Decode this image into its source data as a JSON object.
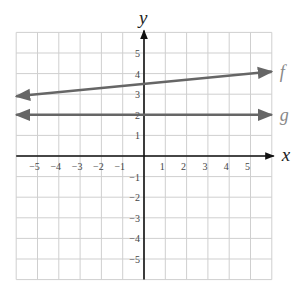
{
  "chart_data": {
    "type": "line",
    "title": "",
    "xlabel": "x",
    "ylabel": "y",
    "xlim": [
      -6,
      6
    ],
    "ylim": [
      -6,
      6
    ],
    "grid": true,
    "x_ticks": [
      -5,
      -4,
      -3,
      -2,
      -1,
      1,
      2,
      3,
      4,
      5
    ],
    "y_ticks": [
      -5,
      -4,
      -3,
      -2,
      -1,
      1,
      2,
      3,
      4,
      5
    ],
    "x_tick_labels": [
      "−5",
      "−4",
      "−3",
      "−2",
      "−1",
      "1",
      "2",
      "3",
      "4",
      "5"
    ],
    "y_tick_labels": [
      "−5",
      "−4",
      "−3",
      "−2",
      "−1",
      "1",
      "2",
      "3",
      "4",
      "5"
    ],
    "series": [
      {
        "name": "f",
        "x": [
          -6,
          6
        ],
        "y": [
          2.9,
          4.1
        ],
        "slope": 0.1,
        "intercept": 3.5,
        "color": "#666666"
      },
      {
        "name": "g",
        "x": [
          -6,
          6
        ],
        "y": [
          2,
          2
        ],
        "slope": 0,
        "intercept": 2,
        "color": "#666666"
      }
    ],
    "legend": "inline labels at right end"
  },
  "labels": {
    "x_axis": "x",
    "y_axis": "y",
    "f": "f",
    "g": "g"
  },
  "colors": {
    "grid": "#cfcfcf",
    "axis": "#111111",
    "line": "#666666",
    "label": "#888888"
  }
}
